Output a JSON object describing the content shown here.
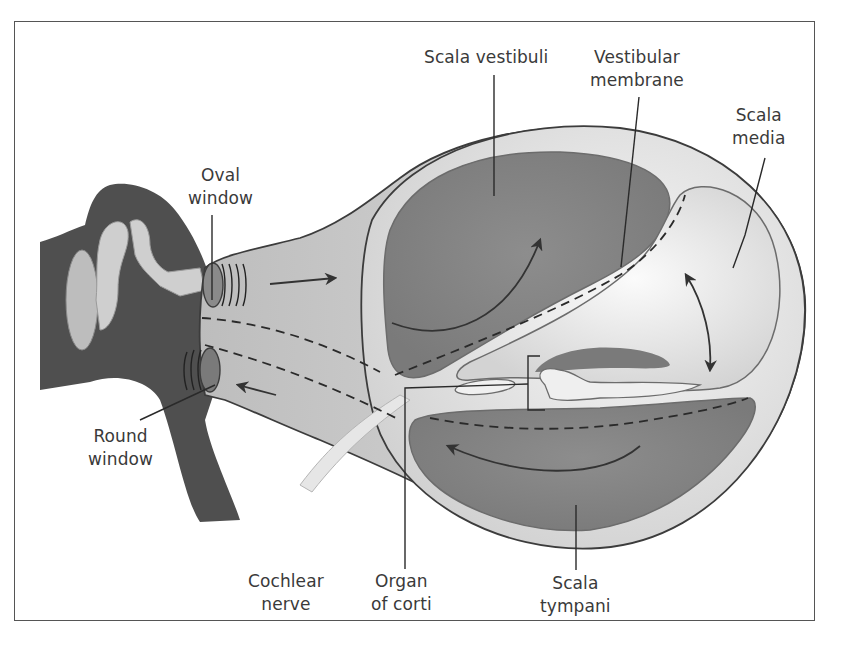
{
  "figure": {
    "labels": {
      "scala_vestibuli": "Scala vestibuli",
      "vestibular_membrane_1": "Vestibular",
      "vestibular_membrane_2": "membrane",
      "scala_media_1": "Scala",
      "scala_media_2": "media",
      "oval_window_1": "Oval",
      "oval_window_2": "window",
      "round_window_1": "Round",
      "round_window_2": "window",
      "cochlear_nerve_1": "Cochlear",
      "cochlear_nerve_2": "nerve",
      "organ_of_corti_1": "Organ",
      "organ_of_corti_2": "of corti",
      "scala_tympani_1": "Scala",
      "scala_tympani_2": "tympani"
    },
    "colors": {
      "frame": "#555555",
      "label_text": "#3a3a3a",
      "bone_dark": "#4a4a4a",
      "chamber_fill": "#8a8a8a",
      "cochlea_light": "#e4e4e4",
      "outline": "#3c3c3c"
    }
  }
}
